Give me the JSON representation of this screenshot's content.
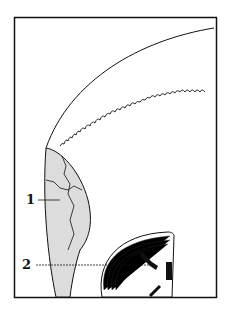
{
  "figure": {
    "labels": [
      {
        "id": "1",
        "text": "1"
      },
      {
        "id": "2",
        "text": "2"
      }
    ],
    "colors": {
      "ink": "#111111",
      "shade": "#dcdcdc",
      "background": "#ffffff"
    }
  }
}
